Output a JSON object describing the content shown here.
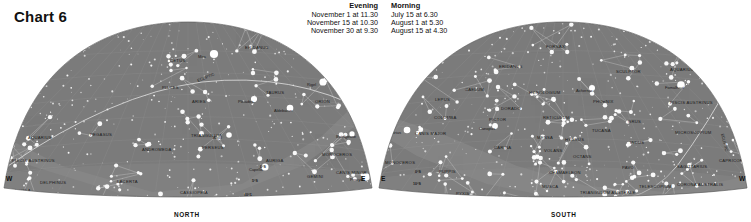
{
  "header": {
    "title": "Chart 6",
    "evening": {
      "heading": "Evening",
      "lines": [
        "November 1 at 11.30",
        "November 15 at 10.30",
        "November 30 at 9.30"
      ]
    },
    "morning": {
      "heading": "Morning",
      "lines": [
        "July 15 at 6.30",
        "August 1 at 5.30",
        "August 15 at 4.30"
      ]
    }
  },
  "colors": {
    "sky": "#7b7b7b",
    "sky_edge": "#6e6e6e",
    "milky_way": "#8d8d8d",
    "star": "#ffffff",
    "line": "#c9c9c9",
    "grid": "#a9a9a9",
    "label": "#1a1a1a",
    "page": "#ffffff"
  },
  "charts": {
    "north": {
      "name": "north-hemisphere-map",
      "bottom_label": "NORTH",
      "cardinal_left": "W",
      "cardinal_right": "E",
      "ecliptic_label": "ECLIPTIC",
      "declination_labels": [
        "0°S",
        "5°S",
        "10°S",
        "15°S",
        "20°S"
      ],
      "constellations": [
        {
          "name": "CETUS",
          "x": 168,
          "y": 46
        },
        {
          "name": "ERIDANUS",
          "x": 243,
          "y": 33
        },
        {
          "name": "PISCES",
          "x": 160,
          "y": 73
        },
        {
          "name": "ARIES",
          "x": 190,
          "y": 87
        },
        {
          "name": "TAURUS",
          "x": 264,
          "y": 78
        },
        {
          "name": "ORION",
          "x": 313,
          "y": 87
        },
        {
          "name": "PEGASUS",
          "x": 88,
          "y": 120
        },
        {
          "name": "AQUARIUS",
          "x": 26,
          "y": 123
        },
        {
          "name": "ANDROMEDA",
          "x": 140,
          "y": 135
        },
        {
          "name": "TRIANGULUM",
          "x": 189,
          "y": 121
        },
        {
          "name": "PERSEUS",
          "x": 200,
          "y": 133
        },
        {
          "name": "AURIGA",
          "x": 264,
          "y": 146
        },
        {
          "name": "GEMINI",
          "x": 305,
          "y": 162
        },
        {
          "name": "MONOCEROS",
          "x": 320,
          "y": 140
        },
        {
          "name": "CANIS MINOR",
          "x": 334,
          "y": 158
        },
        {
          "name": "PISCIS AUSTRINUS",
          "x": 10,
          "y": 146
        },
        {
          "name": "DELPHINUS",
          "x": 38,
          "y": 168
        },
        {
          "name": "AQUILA",
          "x": 12,
          "y": 176
        },
        {
          "name": "LACERTA",
          "x": 115,
          "y": 167
        },
        {
          "name": "CASSIOPEIA",
          "x": 178,
          "y": 178
        },
        {
          "name": "CYGNUS",
          "x": 95,
          "y": 187
        },
        {
          "name": "CEPHEUS",
          "x": 155,
          "y": 202
        },
        {
          "name": "CAMELOPARDALIS",
          "x": 215,
          "y": 197
        },
        {
          "name": "LYNX",
          "x": 268,
          "y": 199
        }
      ],
      "stars_named": [
        {
          "name": "Mira",
          "x": 196,
          "y": 42
        },
        {
          "name": "Aldebaran",
          "x": 272,
          "y": 96
        },
        {
          "name": "Rigel",
          "x": 305,
          "y": 70
        },
        {
          "name": "Betelgeuse",
          "x": 334,
          "y": 122
        },
        {
          "name": "Pleiades",
          "x": 236,
          "y": 87
        },
        {
          "name": "Algol",
          "x": 211,
          "y": 123
        },
        {
          "name": "Capella",
          "x": 247,
          "y": 155
        },
        {
          "name": "Procyon",
          "x": 348,
          "y": 165
        },
        {
          "name": "Castor",
          "x": 290,
          "y": 199
        },
        {
          "name": "Pollux",
          "x": 303,
          "y": 207
        },
        {
          "name": "Deneb",
          "x": 77,
          "y": 197
        }
      ]
    },
    "south": {
      "name": "south-hemisphere-map",
      "bottom_label": "SOUTH",
      "cardinal_left": "E",
      "cardinal_right": "W",
      "ecliptic_label": "ECLIPTIC",
      "declination_labels": [
        "0°S",
        "10°S",
        "20°S",
        "30°S"
      ],
      "constellations": [
        {
          "name": "FORNAX",
          "x": 169,
          "y": 32
        },
        {
          "name": "ERIDANUS",
          "x": 122,
          "y": 52
        },
        {
          "name": "SCULPTOR",
          "x": 239,
          "y": 57
        },
        {
          "name": "AQUARIUS",
          "x": 293,
          "y": 55
        },
        {
          "name": "CAELUM",
          "x": 88,
          "y": 75
        },
        {
          "name": "HOROLOGIUM",
          "x": 152,
          "y": 78
        },
        {
          "name": "LEPUS",
          "x": 58,
          "y": 85
        },
        {
          "name": "PHOENIX",
          "x": 216,
          "y": 87
        },
        {
          "name": "DORADO",
          "x": 124,
          "y": 94
        },
        {
          "name": "PISCIS AUSTRINUS",
          "x": 293,
          "y": 88
        },
        {
          "name": "GRUS",
          "x": 251,
          "y": 107
        },
        {
          "name": "COLUMBA",
          "x": 57,
          "y": 103
        },
        {
          "name": "PICTOR",
          "x": 112,
          "y": 105
        },
        {
          "name": "RETICULUM",
          "x": 166,
          "y": 103
        },
        {
          "name": "CANIS MAJOR",
          "x": 38,
          "y": 119
        },
        {
          "name": "MENSA",
          "x": 160,
          "y": 123
        },
        {
          "name": "TUCANA",
          "x": 215,
          "y": 116
        },
        {
          "name": "HYDRUS",
          "x": 188,
          "y": 125
        },
        {
          "name": "INDUS",
          "x": 253,
          "y": 128
        },
        {
          "name": "MICROSCOPIUM",
          "x": 298,
          "y": 118
        },
        {
          "name": "CARINA",
          "x": 117,
          "y": 133
        },
        {
          "name": "VOLANS",
          "x": 167,
          "y": 136
        },
        {
          "name": "OCTANS",
          "x": 196,
          "y": 142
        },
        {
          "name": "MONOCEROS",
          "x": 8,
          "y": 148
        },
        {
          "name": "PUPPIS",
          "x": 62,
          "y": 157
        },
        {
          "name": "PAVO",
          "x": 245,
          "y": 153
        },
        {
          "name": "SAGITTARIUS",
          "x": 300,
          "y": 152
        },
        {
          "name": "CAPRICORNUS",
          "x": 342,
          "y": 146
        },
        {
          "name": "CHAMAELEON",
          "x": 172,
          "y": 158
        },
        {
          "name": "MUSCA",
          "x": 165,
          "y": 172
        },
        {
          "name": "PYXIS",
          "x": 79,
          "y": 179
        },
        {
          "name": "VELA",
          "x": 112,
          "y": 183
        },
        {
          "name": "TELESCOPIUM",
          "x": 262,
          "y": 172
        },
        {
          "name": "CORONA AUSTRALIS",
          "x": 300,
          "y": 170
        },
        {
          "name": "TRIANGULUM AUSTRALE",
          "x": 203,
          "y": 178
        },
        {
          "name": "ANTLIA",
          "x": 69,
          "y": 193
        },
        {
          "name": "ARA",
          "x": 244,
          "y": 185
        },
        {
          "name": "CIRCINUS",
          "x": 225,
          "y": 192
        },
        {
          "name": "SCORPIUS",
          "x": 275,
          "y": 193
        },
        {
          "name": "CRUX",
          "x": 170,
          "y": 201
        },
        {
          "name": "CEN",
          "x": 138,
          "y": 200
        }
      ],
      "stars_named": [
        {
          "name": "Achernar",
          "x": 199,
          "y": 76
        },
        {
          "name": "Fomalhaut",
          "x": 288,
          "y": 73
        },
        {
          "name": "Canopus",
          "x": 102,
          "y": 114
        },
        {
          "name": "Sirius",
          "x": 14,
          "y": 118
        },
        {
          "name": "Acrux",
          "x": 172,
          "y": 188
        },
        {
          "name": "Mimosa",
          "x": 175,
          "y": 195
        },
        {
          "name": "Hadar",
          "x": 186,
          "y": 202
        },
        {
          "name": "Rigil Kent",
          "x": 204,
          "y": 202
        }
      ]
    }
  }
}
